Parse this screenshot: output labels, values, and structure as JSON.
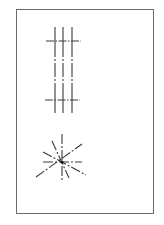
{
  "figure": {
    "frame": {
      "x": 16,
      "y": 9,
      "width": 137,
      "height": 204,
      "color": "#6b6b6b"
    },
    "line_color": "#3a3a3a",
    "grid_lines": {
      "verticals": [
        {
          "x": 55,
          "y1": 27,
          "y2": 117
        },
        {
          "x": 63,
          "y1": 27,
          "y2": 117
        },
        {
          "x": 72,
          "y1": 27,
          "y2": 117
        }
      ],
      "horizontals": [
        {
          "y": 41,
          "x1": 46,
          "x2": 81
        },
        {
          "y": 100,
          "x1": 45,
          "x2": 80
        }
      ]
    },
    "starburst": {
      "center": {
        "x": 62,
        "y": 162
      },
      "rays": [
        {
          "x1": 62,
          "y1": 134,
          "x2": 62,
          "y2": 182
        },
        {
          "x1": 43,
          "y1": 162,
          "x2": 82,
          "y2": 162
        },
        {
          "x1": 52,
          "y1": 141,
          "x2": 69,
          "y2": 178
        },
        {
          "x1": 43,
          "y1": 152,
          "x2": 86,
          "y2": 175
        },
        {
          "x1": 36,
          "y1": 177,
          "x2": 82,
          "y2": 144
        }
      ]
    }
  }
}
